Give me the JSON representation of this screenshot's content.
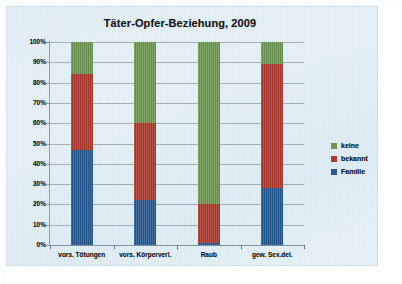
{
  "chart_data": {
    "type": "bar",
    "stacked": true,
    "normalized": "100%",
    "title": "Täter-Opfer-Beziehung, 2009",
    "xlabel": "",
    "ylabel": "",
    "ylim": [
      0,
      100
    ],
    "grid": true,
    "legend_position": "right",
    "categories": [
      "vors. Tötungen",
      "vors. Körperverl.",
      "Raub",
      "gew. Sex.del."
    ],
    "ytick_labels": [
      "100%",
      "90%",
      "80%",
      "70%",
      "60%",
      "50%",
      "40%",
      "30%",
      "20%",
      "10%",
      "0%"
    ],
    "ytick_values": [
      100,
      90,
      80,
      70,
      60,
      50,
      40,
      30,
      20,
      10,
      0
    ],
    "series": [
      {
        "name": "Familie",
        "color": "#27598f",
        "values": [
          47,
          22,
          1,
          28
        ]
      },
      {
        "name": "bekannt",
        "color": "#ab3a2d",
        "values": [
          37,
          38,
          19,
          61
        ]
      },
      {
        "name": "keine",
        "color": "#6c9652",
        "values": [
          16,
          40,
          80,
          11
        ]
      }
    ],
    "stack_order_bottom_to_top": [
      "Familie",
      "bekannt",
      "keine"
    ],
    "legend_entries": [
      {
        "label": "keine",
        "color": "#6c9652"
      },
      {
        "label": "bekannt",
        "color": "#ab3a2d"
      },
      {
        "label": "Familie",
        "color": "#27598f"
      }
    ]
  },
  "colors": {
    "panel_background": "#dfecf4",
    "page_background": "#ffffff",
    "gridline": "#8c9aa6",
    "axis": "#6d7d8a",
    "text": "#111111",
    "familie": "#27598f",
    "bekannt": "#ab3a2d",
    "keine": "#6c9652"
  }
}
